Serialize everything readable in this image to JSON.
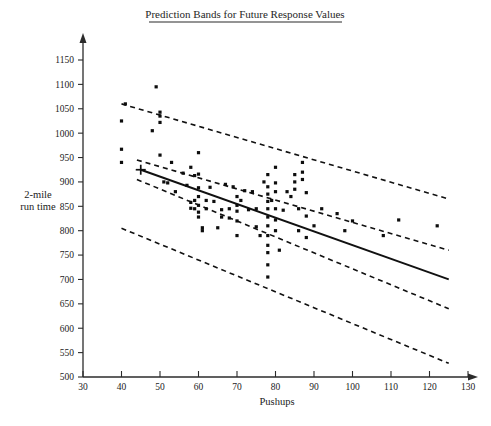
{
  "chart_data": {
    "type": "scatter",
    "title": "Prediction Bands for Future Response Values",
    "xlabel": "Pushups",
    "ylabel": "2-mile run time",
    "ylabel_line1": "2-mile",
    "ylabel_line2": "run time",
    "xlim": [
      30,
      130
    ],
    "ylim": [
      500,
      1150
    ],
    "xticks": [
      30,
      40,
      50,
      60,
      70,
      80,
      90,
      100,
      110,
      120,
      130
    ],
    "yticks": [
      500,
      550,
      600,
      650,
      700,
      750,
      800,
      850,
      900,
      950,
      1000,
      1050,
      1100,
      1150
    ],
    "xtick_labels": [
      "30",
      "40",
      "50",
      "60",
      "70",
      "80",
      "90",
      "100",
      "110",
      "120",
      "130"
    ],
    "ytick_labels": [
      "500",
      "550",
      "600",
      "650",
      "700",
      "750",
      "800",
      "850",
      "900",
      "950",
      "1000",
      "1050",
      "1100",
      "1150"
    ],
    "grid": false,
    "legend": false,
    "line_color": "#111111",
    "band_color": "#111111",
    "point_color": "#0d0d0d",
    "points": [
      [
        40,
        1025
      ],
      [
        40,
        967
      ],
      [
        40,
        940
      ],
      [
        41,
        1060
      ],
      [
        48,
        1005
      ],
      [
        49,
        1095
      ],
      [
        50,
        1043
      ],
      [
        50,
        1035
      ],
      [
        50,
        1022
      ],
      [
        50,
        955
      ],
      [
        51,
        900
      ],
      [
        52,
        898
      ],
      [
        53,
        940
      ],
      [
        54,
        880
      ],
      [
        56,
        918
      ],
      [
        57,
        893
      ],
      [
        58,
        930
      ],
      [
        58,
        858
      ],
      [
        58,
        846
      ],
      [
        59,
        913
      ],
      [
        59,
        862
      ],
      [
        59,
        845
      ],
      [
        60,
        960
      ],
      [
        60,
        916
      ],
      [
        60,
        888
      ],
      [
        60,
        870
      ],
      [
        60,
        852
      ],
      [
        60,
        838
      ],
      [
        60,
        828
      ],
      [
        61,
        806
      ],
      [
        61,
        800
      ],
      [
        62,
        862
      ],
      [
        62,
        845
      ],
      [
        63,
        889
      ],
      [
        64,
        860
      ],
      [
        65,
        806
      ],
      [
        66,
        843
      ],
      [
        66,
        828
      ],
      [
        67,
        895
      ],
      [
        68,
        845
      ],
      [
        68,
        826
      ],
      [
        69,
        890
      ],
      [
        70,
        870
      ],
      [
        70,
        852
      ],
      [
        70,
        840
      ],
      [
        70,
        820
      ],
      [
        70,
        790
      ],
      [
        71,
        862
      ],
      [
        72,
        882
      ],
      [
        73,
        843
      ],
      [
        74,
        880
      ],
      [
        75,
        845
      ],
      [
        75,
        808
      ],
      [
        76,
        790
      ],
      [
        77,
        900
      ],
      [
        78,
        915
      ],
      [
        78,
        890
      ],
      [
        78,
        875
      ],
      [
        78,
        860
      ],
      [
        78,
        845
      ],
      [
        78,
        828
      ],
      [
        78,
        810
      ],
      [
        78,
        790
      ],
      [
        78,
        770
      ],
      [
        78,
        755
      ],
      [
        78,
        730
      ],
      [
        78,
        705
      ],
      [
        79,
        862
      ],
      [
        80,
        930
      ],
      [
        80,
        898
      ],
      [
        80,
        880
      ],
      [
        80,
        845
      ],
      [
        80,
        822
      ],
      [
        80,
        800
      ],
      [
        81,
        760
      ],
      [
        82,
        842
      ],
      [
        83,
        880
      ],
      [
        84,
        870
      ],
      [
        85,
        915
      ],
      [
        85,
        900
      ],
      [
        85,
        885
      ],
      [
        86,
        845
      ],
      [
        86,
        800
      ],
      [
        87,
        940
      ],
      [
        87,
        920
      ],
      [
        87,
        905
      ],
      [
        88,
        878
      ],
      [
        88,
        830
      ],
      [
        88,
        786
      ],
      [
        90,
        810
      ],
      [
        92,
        845
      ],
      [
        96,
        835
      ],
      [
        98,
        800
      ],
      [
        100,
        820
      ],
      [
        108,
        790
      ],
      [
        112,
        822
      ],
      [
        122,
        810
      ]
    ],
    "centroid": [
      45,
      925
    ],
    "regression": {
      "x1": 45,
      "y1": 925,
      "x2": 125,
      "y2": 700
    },
    "bands": [
      {
        "name": "upper-prediction-band",
        "x1": 40,
        "y1": 1060,
        "x2": 125,
        "y2": 865
      },
      {
        "name": "upper-confidence-band",
        "x1": 44,
        "y1": 945,
        "x2": 125,
        "y2": 760
      },
      {
        "name": "lower-confidence-band",
        "x1": 44,
        "y1": 905,
        "x2": 125,
        "y2": 640
      },
      {
        "name": "lower-prediction-band",
        "x1": 40,
        "y1": 805,
        "x2": 125,
        "y2": 528
      }
    ]
  }
}
